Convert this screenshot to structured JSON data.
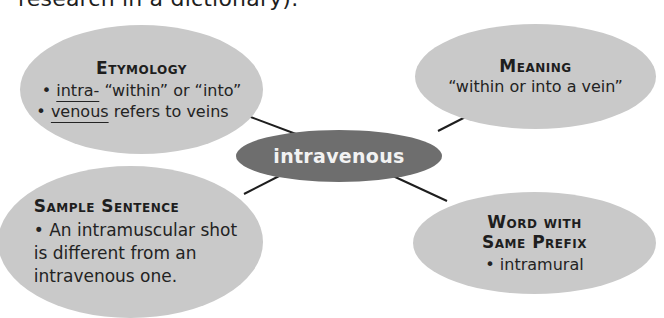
{
  "page": {
    "top_text": "research in a dictionary)."
  },
  "colors": {
    "outer_oval": "#c9c9c9",
    "center_oval": "#6e6e6e",
    "center_text": "#f2f2f2",
    "connector": "#1e1e1e",
    "text": "#1e1e1e"
  },
  "center": {
    "word": "intravenous"
  },
  "etymology": {
    "title": "Etymology",
    "items": [
      {
        "bullet": "•",
        "underlined": "intra-",
        "rest": " “within” or “into”"
      },
      {
        "bullet": "•",
        "underlined": "venous",
        "rest": " refers to veins"
      }
    ]
  },
  "meaning": {
    "title": "Meaning",
    "text": "“within or into a vein”"
  },
  "sample_sentence": {
    "title": "Sample Sentence",
    "lines": [
      "• An intramuscular shot",
      "is different from an",
      "intravenous one."
    ]
  },
  "same_prefix": {
    "title_line1": "Word with",
    "title_line2": "Same Prefix",
    "item": "• intramural"
  }
}
